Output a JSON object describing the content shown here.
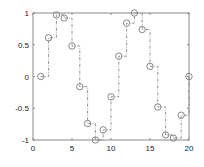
{
  "chart_data": {
    "type": "line",
    "style": "stairs with circle markers, dash-dot line",
    "title": "",
    "xlabel": "",
    "ylabel": "",
    "xlim": [
      0,
      20
    ],
    "ylim": [
      -1,
      1
    ],
    "grid": false,
    "legend": null,
    "x_ticks": [
      0,
      5,
      10,
      15,
      20
    ],
    "x_tick_labels": [
      "0",
      "5",
      "10",
      "15",
      "20"
    ],
    "y_ticks": [
      -1,
      -0.5,
      0,
      0.5,
      1
    ],
    "y_tick_labels": [
      "-1",
      "-0.5",
      "0",
      "0.5",
      "1"
    ],
    "x": [
      1,
      2,
      3,
      4,
      5,
      6,
      7,
      8,
      9,
      10,
      11,
      12,
      13,
      14,
      15,
      16,
      17,
      18,
      19,
      20
    ],
    "series": [
      {
        "name": "sin",
        "values": [
          0,
          0.61,
          0.97,
          0.92,
          0.48,
          -0.16,
          -0.74,
          -1.0,
          -0.84,
          -0.32,
          0.32,
          0.84,
          1.0,
          0.74,
          0.16,
          -0.48,
          -0.92,
          -0.97,
          -0.61,
          0
        ],
        "color": "#7a7a7a",
        "marker": "circle"
      }
    ]
  },
  "colors": {
    "axis": "#8a8a8a",
    "series": "#7a7a7a",
    "background": "#ffffff"
  }
}
